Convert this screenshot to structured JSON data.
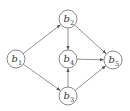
{
  "diagram": {
    "type": "directed-graph",
    "nodes": [
      {
        "id": "b1",
        "base": "b",
        "sub": "1",
        "x": 16,
        "y": 59
      },
      {
        "id": "b2",
        "base": "b",
        "sub": "2",
        "x": 68,
        "y": 19
      },
      {
        "id": "b3",
        "base": "b",
        "sub": "3",
        "x": 68,
        "y": 96
      },
      {
        "id": "b4",
        "base": "b",
        "sub": "4",
        "x": 68,
        "y": 59
      },
      {
        "id": "b5",
        "base": "b",
        "sub": "5",
        "x": 113,
        "y": 60
      }
    ],
    "edges": [
      {
        "from": "b1",
        "to": "b2"
      },
      {
        "from": "b1",
        "to": "b3"
      },
      {
        "from": "b2",
        "to": "b4"
      },
      {
        "from": "b2",
        "to": "b5"
      },
      {
        "from": "b3",
        "to": "b4"
      },
      {
        "from": "b3",
        "to": "b5"
      },
      {
        "from": "b4",
        "to": "b5"
      }
    ],
    "node_radius": 9,
    "colors": {
      "stroke": "#6a6a6a",
      "edge": "#777777",
      "text": "#333333",
      "background": "#ffffff"
    }
  }
}
